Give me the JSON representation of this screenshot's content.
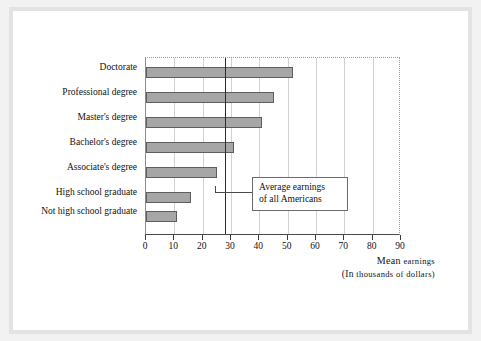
{
  "chart_data": {
    "type": "bar",
    "orientation": "horizontal",
    "title": "",
    "categories": [
      "Doctorate",
      "Professional degree",
      "Master's degree",
      "Bachelor's degree",
      "Associate's degree",
      "High school graduate",
      "Not high school graduate"
    ],
    "values": [
      52,
      45,
      41,
      31,
      25,
      16,
      11
    ],
    "xlabel_line1": "Mean earnings",
    "xlabel_line2": "(in thousands of dollars)",
    "ylabel": "",
    "xlim": [
      0,
      90
    ],
    "xticks": [
      0,
      10,
      20,
      30,
      40,
      50,
      60,
      70,
      80,
      90
    ],
    "xtick_labels": [
      "0",
      "10",
      "20",
      "30",
      "40",
      "50",
      "60",
      "70",
      "80",
      "90"
    ],
    "grid": "vertical",
    "legend": "none",
    "reference_line": {
      "value": 28,
      "label_line1": "Average earnings",
      "label_line2": "of all Americans"
    },
    "colors": {
      "bar_fill": "#a6a6a6",
      "bar_stroke": "#5e5e5e",
      "gridline": "#d2d2d2",
      "axis": "#4a4a4a",
      "reference_line": "#2b2b2b",
      "plot_background": "#ffffff",
      "page_background": "#ffffff",
      "frame": "#f2f2f2"
    }
  },
  "annotation": {
    "line1": "Average earnings",
    "line2": "of all Americans"
  },
  "axis": {
    "title_small_caps_1": "Mean",
    "title_rest_1": "earnings",
    "title_small_caps_2": "(In",
    "title_rest_2": "thousands of dollars)"
  }
}
